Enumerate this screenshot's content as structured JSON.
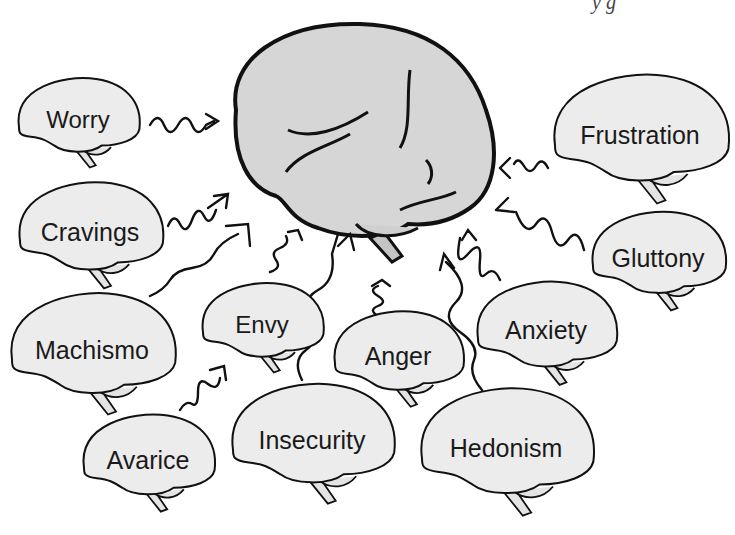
{
  "diagram": {
    "type": "concept-illustration",
    "colors": {
      "brain_fill": "#d6d6d6",
      "small_fill": "#ececec",
      "outline": "#111111",
      "background": "#ffffff"
    },
    "top_fragment": "y g",
    "central": {
      "label": ""
    },
    "nodes": [
      {
        "id": "worry",
        "label": "Worry",
        "x": 78,
        "y": 120,
        "w": 118
      },
      {
        "id": "cravings",
        "label": "Cravings",
        "x": 90,
        "y": 232,
        "w": 140
      },
      {
        "id": "machismo",
        "label": "Machismo",
        "x": 92,
        "y": 350,
        "w": 160
      },
      {
        "id": "envy",
        "label": "Envy",
        "x": 262,
        "y": 325,
        "w": 118
      },
      {
        "id": "avarice",
        "label": "Avarice",
        "x": 148,
        "y": 460,
        "w": 128
      },
      {
        "id": "insecurity",
        "label": "Insecurity",
        "x": 312,
        "y": 440,
        "w": 158
      },
      {
        "id": "anger",
        "label": "Anger",
        "x": 398,
        "y": 356,
        "w": 126
      },
      {
        "id": "hedonism",
        "label": "Hedonism",
        "x": 506,
        "y": 448,
        "w": 168
      },
      {
        "id": "anxiety",
        "label": "Anxiety",
        "x": 546,
        "y": 330,
        "w": 136
      },
      {
        "id": "frustration",
        "label": "Frustration",
        "x": 640,
        "y": 135,
        "w": 170
      },
      {
        "id": "gluttony",
        "label": "Gluttony",
        "x": 658,
        "y": 258,
        "w": 130
      }
    ],
    "arrows": [
      {
        "from": "worry",
        "d": "M150 125 q8 -14 14 0 t14 0 t14 0 t14 0 l8 -4 M206 114 l12 7 l-12 8"
      },
      {
        "from": "cravings",
        "d": "M168 226 q6 -14 12 -2 t12 -4 t12 -4 t12 -6 M214 196 l14 -2 l-2 14 M228 194 l-20 14"
      },
      {
        "from": "machismo",
        "d": "M150 296 q14 -6 20 -16 t22 -12 t22 -14 t24 -20 M226 226 l22 -2 l2 22"
      },
      {
        "from": "envy",
        "d": "M270 272 q12 -4 6 -12 t4 -12 t6 -12 M288 232 l10 -2 l4 10"
      },
      {
        "from": "avarice",
        "d": "M180 410 q6 -10 12 -6 t6 -12 t10 -8 t12 -6 M210 370 l14 -4 l2 14"
      },
      {
        "from": "insecurity",
        "d": "M302 380 q-10 -20 4 -30 t4 -30 t8 -30 t14 -36 l6 -20 M338 246 l12 -12 l4 16"
      },
      {
        "from": "anger",
        "d": "M378 316 q-10 -6 0 -10 t0 -10 t0 -10 M372 286 l10 -6 l8 6"
      },
      {
        "from": "hedonism",
        "d": "M482 390 q-14 -16 -8 -30 t-14 -28 t-4 -30 t-10 -40 M440 270 l4 -16 l10 14"
      },
      {
        "from": "anxiety",
        "d": "M500 280 q-6 -14 -14 -6 t-6 -14 t-12 -6 t-8 -16 M462 240 l6 -10 l8 10"
      },
      {
        "from": "frustration",
        "d": "M548 168 q-6 -12 -12 -2 t-12 0 t-10 -2 M500 168 l10 -10 M500 168 l10 10"
      },
      {
        "from": "gluttony",
        "d": "M584 250 q-6 -24 -16 -10 t-16 -8 t-16 -8 t-20 -12 M496 210 l12 -12 M496 210 l18 2"
      }
    ]
  }
}
